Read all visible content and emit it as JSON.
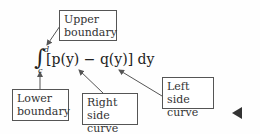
{
  "formula": {
    "integral_sign": "∫",
    "upper_limit": "d",
    "lower_limit": "c",
    "expression": "[p(y) − q(y)] dy"
  },
  "labels": {
    "upper_boundary": {
      "line1": "Upper",
      "line2": "boundary"
    },
    "lower_boundary": {
      "line1": "Lower",
      "line2": "boundary"
    },
    "right_side_curve": {
      "line1": "Right side",
      "line2": "curve"
    },
    "left_side_curve": {
      "line1": "Left side",
      "line2": "curve"
    }
  },
  "colors": {
    "arrow": "#555555",
    "box_border": "#555555",
    "text": "#333333"
  }
}
